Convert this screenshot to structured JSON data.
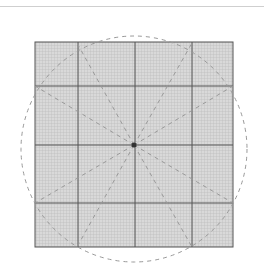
{
  "diagram": {
    "grid": {
      "x": 35,
      "y": 42,
      "width": 198,
      "height": 205,
      "fill": "#d4d4d4",
      "fine_line_color": "#bdbdbd",
      "major_line_color": "#555555",
      "fine_spacing": 3
    },
    "major_vertical_x": [
      78,
      135,
      192
    ],
    "major_horizontal_y": [
      86,
      145,
      203
    ],
    "center": {
      "x": 134,
      "y": 145
    },
    "circle": {
      "cx": 134,
      "cy": 149,
      "r": 113,
      "color": "#999999"
    },
    "ray_endpoints": [
      [
        77,
        43
      ],
      [
        192,
        43
      ],
      [
        233,
        86
      ],
      [
        233,
        203
      ],
      [
        192,
        247
      ],
      [
        77,
        247
      ],
      [
        35,
        203
      ],
      [
        35,
        86
      ]
    ],
    "dot_color": "#333333"
  }
}
